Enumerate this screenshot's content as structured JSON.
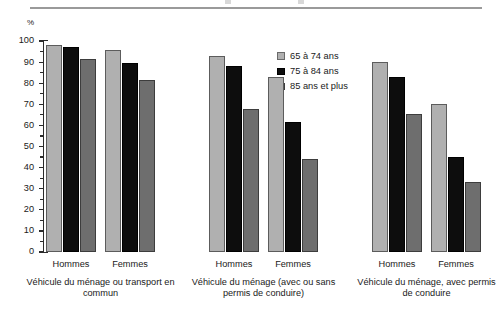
{
  "chart_data": {
    "type": "bar",
    "title": "",
    "subtitle": "",
    "unit_label": "%",
    "xlabel": "",
    "ylabel": "",
    "ylim": [
      0,
      100
    ],
    "ytick_step": 10,
    "yminor_step": 5,
    "grid": false,
    "legend_position": "inside-top-center",
    "yticks": [
      "0",
      "10",
      "20",
      "30",
      "40",
      "50",
      "60",
      "70",
      "80",
      "90",
      "100"
    ],
    "series": [
      {
        "name": "65 à 74 ans",
        "color": "#b0b0b0",
        "values": [
          98.0,
          95.5,
          93.0,
          83.0,
          90.0,
          70.0
        ]
      },
      {
        "name": "75 à 84 ans",
        "color": "#0d0d0d",
        "values": [
          97.0,
          89.5,
          88.0,
          61.5,
          83.0,
          45.0
        ]
      },
      {
        "name": "85 ans et plus",
        "color": "#6e6e6e",
        "values": [
          91.5,
          81.5,
          68.0,
          44.0,
          65.5,
          33.0
        ]
      }
    ],
    "categories": [
      "Hommes",
      "Femmes",
      "Hommes",
      "Femmes",
      "Hommes",
      "Femmes"
    ],
    "groups": [
      {
        "label": "Véhicule du ménage ou transport en commun",
        "categories": [
          "Hommes",
          "Femmes"
        ]
      },
      {
        "label": "Véhicule du ménage (avec ou sans permis de conduire)",
        "categories": [
          "Hommes",
          "Femmes"
        ]
      },
      {
        "label": "Véhicule du ménage, avec permis de conduire",
        "categories": [
          "Hommes",
          "Femmes"
        ]
      }
    ]
  },
  "legend": {
    "items": [
      {
        "label": "65 à 74 ans"
      },
      {
        "label": "75 à 84 ans"
      },
      {
        "label": "85 ans et plus"
      }
    ]
  }
}
